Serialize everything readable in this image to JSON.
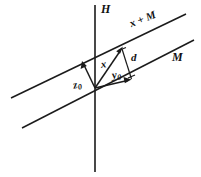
{
  "figure": {
    "kind": "geometric-diagram",
    "background_color": "#ffffff",
    "stroke_color": "#1b1b1b",
    "width": 201,
    "height": 177,
    "labels": {
      "hyperplane": "H",
      "coset": "x + M",
      "subspace": "M",
      "vector_x": "x",
      "distance": "d",
      "vector_y0_base": "y",
      "vector_y0_sub": "0",
      "vector_z0_base": "z",
      "vector_z0_sub": "0"
    },
    "elements": [
      {
        "name": "vertical-axis-H",
        "type": "line",
        "from": [
          95,
          5
        ],
        "to": [
          95,
          172
        ]
      },
      {
        "name": "coset-line-x-plus-M",
        "type": "line",
        "from": [
          11,
          98
        ],
        "to": [
          186,
          14
        ]
      },
      {
        "name": "subspace-line-M",
        "type": "line",
        "from": [
          22,
          128
        ],
        "to": [
          194,
          40
        ]
      },
      {
        "name": "vector-x",
        "type": "arrow",
        "from": [
          95,
          88
        ],
        "to": [
          122,
          48
        ]
      },
      {
        "name": "vector-y0",
        "type": "arrow",
        "from": [
          95,
          88
        ],
        "to": [
          131,
          80
        ]
      },
      {
        "name": "vector-z0",
        "type": "arrow",
        "from": [
          95,
          88
        ],
        "to": [
          82,
          61
        ]
      },
      {
        "name": "distance-segment-d",
        "type": "line",
        "from": [
          122,
          49
        ],
        "to": [
          131,
          79
        ]
      }
    ]
  }
}
